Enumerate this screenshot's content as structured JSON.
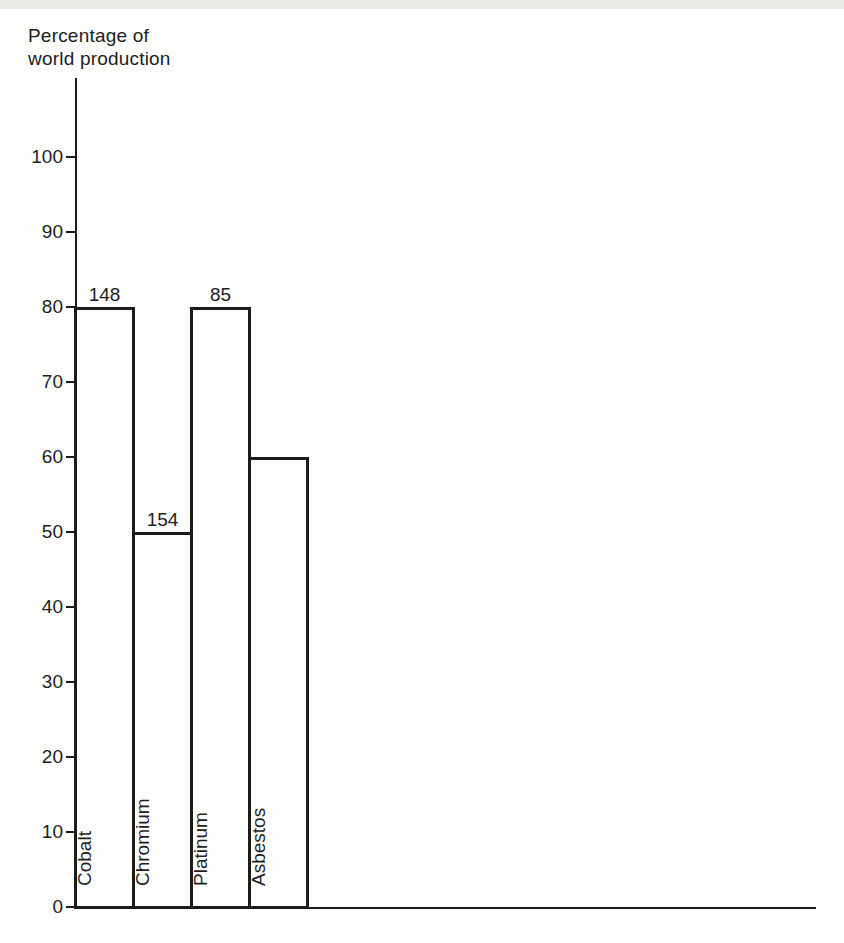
{
  "title_lines": [
    "Percentage of",
    "world production"
  ],
  "chart_data": {
    "type": "bar",
    "title": "Percentage of world production",
    "ylabel": "Percentage of world production",
    "xlabel": "",
    "categories": [
      "Cobalt",
      "Chromium",
      "Platinum",
      "Asbestos"
    ],
    "values": [
      80,
      50,
      80,
      60
    ],
    "bar_labels": [
      "148",
      "154",
      "85",
      ""
    ],
    "ylim": [
      0,
      110
    ],
    "yticks": [
      0,
      10,
      20,
      30,
      40,
      50,
      60,
      70,
      80,
      90,
      100
    ],
    "grid": false,
    "legend": "none",
    "bar_fill": "#fdfdfc",
    "line_color": "#1b1b1b"
  },
  "colors": {
    "ink": "#1e1e1e",
    "line": "#1b1b1b",
    "paper": "#fdfdfc",
    "scan_band": "#e9e9e6"
  }
}
